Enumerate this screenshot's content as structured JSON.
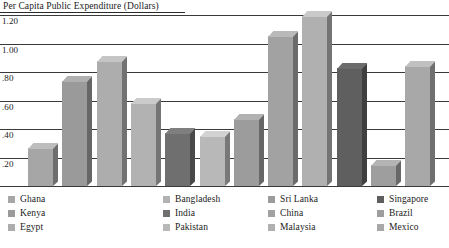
{
  "chart_data": {
    "type": "bar",
    "title": "Per Capita Public Expenditure (Dollars)",
    "xlabel": "",
    "ylabel": "",
    "ylim": [
      0,
      1.2
    ],
    "grid": true,
    "legend_position": "bottom",
    "ytick_labels": [
      "1.20",
      "1.00",
      ".80",
      ".60",
      ".40",
      ".20"
    ],
    "ytick_values": [
      1.2,
      1.0,
      0.8,
      0.6,
      0.4,
      0.2
    ],
    "categories": [
      "Ghana",
      "Kenya",
      "Egypt",
      "Bangladesh",
      "India",
      "Pakistan",
      "Sri Lanka",
      "China",
      "Malaysia",
      "Singapore",
      "Brazil",
      "Mexico"
    ],
    "values": [
      0.27,
      0.74,
      0.88,
      0.58,
      0.37,
      0.35,
      0.47,
      1.05,
      1.19,
      0.83,
      0.15,
      0.84
    ],
    "bar_colors": [
      "#a6a6a6",
      "#9a9a9a",
      "#adadad",
      "#b2b2b2",
      "#6f6f6f",
      "#b8b8b8",
      "#9c9c9c",
      "#a2a2a2",
      "#b0b0b0",
      "#5f5f5f",
      "#9e9e9e",
      "#a8a8a8"
    ]
  },
  "legend": {
    "columns": [
      {
        "items": [
          {
            "label": "Ghana",
            "color": "#a6a6a6"
          },
          {
            "label": "Kenya",
            "color": "#9a9a9a"
          },
          {
            "label": "Egypt",
            "color": "#adadad"
          }
        ]
      },
      {
        "items": [
          {
            "label": "Bangladesh",
            "color": "#b2b2b2"
          },
          {
            "label": "India",
            "color": "#6f6f6f"
          },
          {
            "label": "Pakistan",
            "color": "#b8b8b8"
          }
        ]
      },
      {
        "items": [
          {
            "label": "Sri Lanka",
            "color": "#9c9c9c"
          },
          {
            "label": "China",
            "color": "#a2a2a2"
          },
          {
            "label": "Malaysia",
            "color": "#b0b0b0"
          }
        ]
      },
      {
        "items": [
          {
            "label": "Singapore",
            "color": "#5f5f5f"
          },
          {
            "label": "Brazil",
            "color": "#9e9e9e"
          },
          {
            "label": "Mexico",
            "color": "#a8a8a8"
          }
        ]
      }
    ]
  },
  "style": {
    "grid_color": "#3a3a3a",
    "text_color": "#1a1a1a",
    "background": "#ffffff"
  }
}
